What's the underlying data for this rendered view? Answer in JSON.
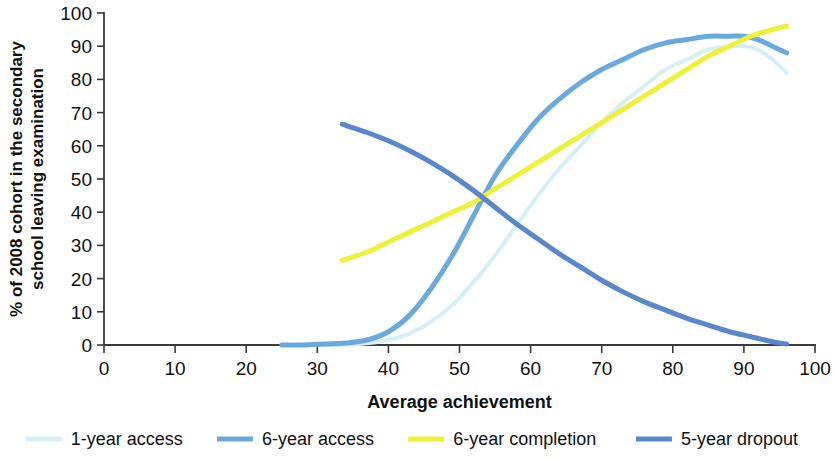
{
  "chart_data": {
    "type": "line",
    "title": "",
    "xlabel": "Average achievement",
    "ylabel": "% of 2008 cohort in the secondary school leaving examination",
    "ylabel_line1": "% of 2008 cohort in the secondary",
    "ylabel_line2": "school leaving examination",
    "xlim": [
      0,
      100
    ],
    "ylim": [
      0,
      100
    ],
    "xticks": [
      0,
      10,
      20,
      30,
      40,
      50,
      60,
      70,
      80,
      90,
      100
    ],
    "yticks": [
      0,
      10,
      20,
      30,
      40,
      50,
      60,
      70,
      80,
      90,
      100
    ],
    "xtick_labels": [
      "0",
      "10",
      "20",
      "30",
      "40",
      "50",
      "60",
      "70",
      "80",
      "90",
      "100"
    ],
    "ytick_labels": [
      "0",
      "10",
      "20",
      "30",
      "40",
      "50",
      "60",
      "70",
      "80",
      "90",
      "100"
    ],
    "grid": false,
    "legend_position": "bottom",
    "series": [
      {
        "name": "1-year access",
        "color": "#d5eef8",
        "width": 4.0,
        "x": [
          31,
          34,
          37,
          40,
          43,
          46,
          49,
          52,
          55,
          58,
          61,
          64,
          67,
          70,
          73,
          76,
          79,
          82,
          85,
          88,
          90,
          92,
          94,
          96
        ],
        "y": [
          0,
          0,
          0.5,
          1.5,
          3.5,
          7,
          12,
          19,
          27,
          36,
          45,
          53,
          60,
          67,
          73,
          78,
          83,
          86,
          89,
          90,
          90,
          89,
          86,
          82
        ]
      },
      {
        "name": "6-year access",
        "color": "#6aa9e0",
        "width": 5.0,
        "x": [
          25,
          28,
          31,
          34,
          37,
          40,
          43,
          46,
          49,
          52,
          55,
          58,
          61,
          64,
          67,
          70,
          73,
          76,
          79,
          82,
          85,
          88,
          90,
          92,
          94,
          96
        ],
        "y": [
          0,
          0,
          0.3,
          0.6,
          1.5,
          4,
          9,
          17,
          27,
          39,
          51,
          60,
          68,
          74,
          79,
          83,
          86,
          89,
          91,
          92,
          93,
          93,
          93,
          92,
          90,
          88
        ]
      },
      {
        "name": "6-year completion",
        "color": "#eef03a",
        "width": 5.0,
        "x": [
          33.5,
          37,
          40,
          43,
          46,
          49,
          52,
          55,
          58,
          61,
          64,
          67,
          70,
          73,
          76,
          79,
          82,
          85,
          88,
          91,
          94,
          96
        ],
        "y": [
          25.5,
          28,
          31,
          34,
          37,
          40,
          43,
          47,
          51,
          55,
          59,
          63,
          67,
          71,
          75,
          79,
          83,
          87,
          90,
          93,
          95,
          96
        ]
      },
      {
        "name": "5-year dropout",
        "color": "#5a86cd",
        "width": 5.0,
        "x": [
          33.5,
          37,
          40,
          43,
          46,
          49,
          52,
          55,
          58,
          61,
          64,
          67,
          70,
          73,
          76,
          79,
          82,
          85,
          88,
          91,
          94,
          96
        ],
        "y": [
          66.5,
          64,
          61.5,
          58.5,
          55,
          51,
          46.5,
          41.5,
          36.5,
          32,
          27.5,
          23.5,
          19.5,
          16,
          13,
          10.5,
          8,
          6,
          4,
          2.5,
          1,
          0.3
        ]
      }
    ],
    "legend": [
      {
        "label": "1-year access",
        "color": "#d5eef8"
      },
      {
        "label": "6-year access",
        "color": "#6aa9e0"
      },
      {
        "label": "6-year completion",
        "color": "#eef03a"
      },
      {
        "label": "5-year dropout",
        "color": "#5a86cd"
      }
    ]
  }
}
